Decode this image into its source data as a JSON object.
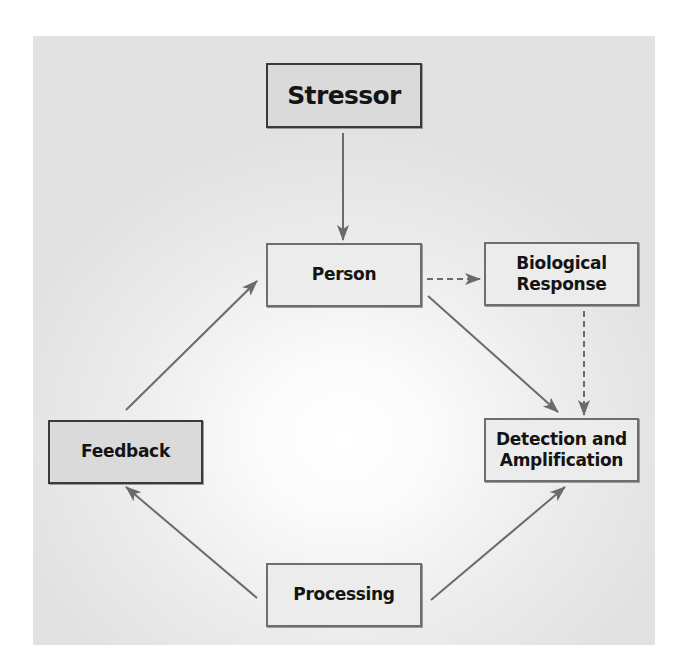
{
  "diagram": {
    "type": "flowchart",
    "background_panel": {
      "center_color": "#ffffff",
      "edge_color": "#e2e2e2"
    },
    "arrow_color": "#6b6b6b",
    "nodes": {
      "stressor": {
        "label": "Stressor",
        "fill": "#dadada"
      },
      "person": {
        "label": "Person",
        "fill": "#ececec"
      },
      "biological_response": {
        "label": "Biological\nResponse",
        "fill": "#ececec"
      },
      "feedback": {
        "label": "Feedback",
        "fill": "#dadada"
      },
      "detection_amplification": {
        "label": "Detection and\nAmplification",
        "fill": "#ececec"
      },
      "processing": {
        "label": "Processing",
        "fill": "#ececec"
      }
    },
    "edges": [
      {
        "from": "Stressor",
        "to": "Person",
        "style": "solid"
      },
      {
        "from": "Person",
        "to": "Biological Response",
        "style": "dashed"
      },
      {
        "from": "Person",
        "to": "Detection and Amplification",
        "style": "solid"
      },
      {
        "from": "Biological Response",
        "to": "Detection and Amplification",
        "style": "dashed"
      },
      {
        "from": "Processing",
        "to": "Detection and Amplification",
        "style": "solid"
      },
      {
        "from": "Processing",
        "to": "Feedback",
        "style": "solid"
      },
      {
        "from": "Feedback",
        "to": "Person",
        "style": "solid"
      }
    ]
  }
}
